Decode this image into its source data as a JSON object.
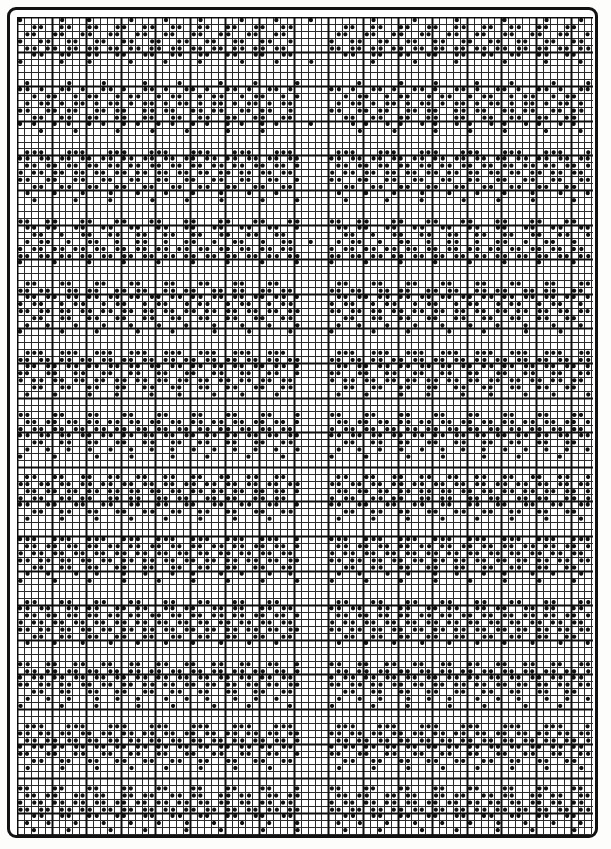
{
  "document": {
    "kind": "needlework-chart",
    "title": "Filet / Cross-Stitch Pattern Chart",
    "frame_color": "#121212",
    "paper_color": "#ffffff",
    "symbol_color": "#101010",
    "thin_line_color": "#2a2a2a",
    "thick_line_color": "#0d0d0d"
  },
  "chart_data": {
    "type": "heatmap",
    "title": "Filet / Cross-Stitch Pattern Chart",
    "xlabel": "",
    "ylabel": "",
    "grid": true,
    "legend_position": "none",
    "columns": 83,
    "rows": 120,
    "cell_px": 6.92,
    "heavy_every": 5,
    "thin_line_px": 1,
    "thick_line_px": 2,
    "symbol": "filled-dot",
    "symbol_radius_ratio": 0.3,
    "values_encoding": "each row string: '1' = stitch / filled dot, '0' = empty cell",
    "rows_data": [
      "10000010001000001000010000100000100001000010000000010000010000010000001000001000010",
      "00110011001100110011001100110011001100110000000110011001100110011001100110011001100",
      "01100110011001100110011001100110011001100000001100110011001100110011001100110011001",
      "10011001100110011001100110011001100110010000010011001100110011001100110011001100110",
      "01101101101101101101101101101101101101100000011011011011011011011011011011011011011",
      "00110011001100110011001100110011001100110000000110011001100110011001100110011001100",
      "10000010001000001000010000100000100001000010000000010000010000010000001000001000010",
      "00000000000000000000000000000000000000000000000000000000000000000000000000000000000",
      "00000000000000000000000000000000000000000000000000000000000000000000000000000000000",
      "01000001000010000010000100000100001000001000000001000001000010000010000100000100001",
      "11010011010011010011010011010011010011010000011010011010011010011010011010011010011",
      "00101100101100101100101100101100101100101000000101100101100101100101100101100101100",
      "01011010110101101011010110101101011010110000001011010110101101011010110101101011010",
      "11001101100110110011011001101100110110010000011001101100110110011011001101100110110",
      "00110011001100110011001100110011001100110000000110011001100110011001100110011001100",
      "10100101001010010100101001010010100101000010000010100101001010010100101001010010100",
      "00010000100000100001000010000010000100000000000001000010000010000100001000001000010",
      "00000000000000000000000000000000000000000000000000000000000000000000000000000000000",
      "00000000000000000000000000000000000000000000000000000000000000000000000000000000000",
      "01110001110001110001110001110001110001110000001110001110001110001110001110001110001",
      "11011011011011011011011011011011011011011000011011011011011011011011011011011011011",
      "01101101101101101101101101101101101101101000001101101101101101101101101101101101101",
      "10110110110110110110110110110110110110110000010110110110110110110110110110110110110",
      "11001100110011001100110011001100110011001000011001100110011001100110011001100110011",
      "00110011001100110011001100110011001100110000000110011001100110011001100110011001100",
      "01000100010001000100010001000100010001000000001000100010001000100010001000100010001",
      "00100000100001000001000010000100000100001000000100000100001000001000010000100000100",
      "00000000000000000000000000000000000000000000000000000000000000000000000000000000000",
      "00000000000000000000000000000000000000000000000000000000000000000000000000000000000",
      "11001100011000110001100011000110001100011000011001100011000110001100011000110001100",
      "01101100110011001100110011001100110011001000001101100110011001100110011001100110011",
      "00110010011001100110011001100110011001100000000110010011001100110011001100110011001",
      "01011001001100100110010011001001100100110010001011001001100100110010011001001100100",
      "10110110110110110110110110110110110110110000010110110110110110110110110110110110110",
      "11011011011011011011011011011011011011011000011011011011011011011011011011011011011",
      "10000100001000010000100001000010000100001000010000100001000010000100001000010000100",
      "00000000000000000000000000000000000000000000000000000000000000000000000000000000000",
      "00000000000000000000000000000000000000000000000000000000000000000000000000000000000",
      "01100011000110001100011000110001100011000000001100011000110001100011000110001100011",
      "11011001101100110110011011001101100110110000011011001101100110110011011001101100110",
      "01101101101101101101101101101101101101101000001101101101101101101101101101101101101",
      "10110010110010110010110010110010110010110000010110010110010110010110010110010110010",
      "11011011011011011011011011011011011011011000011011011011011011011011011011011011011",
      "00110011001100110011001100110011001100110000000110011001100110011001100110011001100",
      "01001000100010001000100010001000100010001000001001000100010001000100010001000100010",
      "10000010000100000100001000001000010000010000010000010000100000100001000001000010000",
      "00000000000000000000000000000000000000000000000000000000000000000000000000000000000",
      "00000000000000000000000000000000000000000000000000000000000000000000000000000000000",
      "01110011100111001110011100111001110011100000001110011100111001110011100111001110011",
      "11011011011011011011011011011011011011011000011011011011011011011011011011011011011",
      "01101101101101101101101101101101101101101000001101101101101101101101101101101101101",
      "11001100110011001100110011001100110011001000011001100110011001100110011001100110011",
      "10110110110110110110110110110110110110110000010110110110110110110110110110110110110",
      "00110011001100110011001100110011001100110000000110011001100110011001100110011001100",
      "01000100001000100001000100001000100001000000001000100001000100001000100001000100001",
      "00000000000000000000000000000000000000000000000000000000000000000000000000000000000",
      "00000000000000000000000000000000000000000000000000000000000000000000000000000000000",
      "11000110001100011000110001100011000110001000011000110001100011000110001100011000110",
      "01101101101101101101101101101101101101101000001101101101101101101101101101101101101",
      "10110110110110110110110110110110110110110000010110110110110110110110110110110110110",
      "11011011011011011011011011011011011011011000011011011011011011011011011011011011011",
      "00110011001100110011001100110011001100110000000110011001100110011001100110011001100",
      "01001001001001001001001001001001001001001000001001001001001001001001001001001001001",
      "10000100000100001000001000010000010000100000010000100000100001000001000010000010000",
      "00000000000000000000000000000000000000000000000000000000000000000000000000000000000",
      "00000000000000000000000000000000000000000000000000000000000000000000000000000000000",
      "01100110011001100110011001100110011001100000001100110011001100110011001100110011001",
      "11011011011011011011011011011011011011011000011011011011011011011011011011011011011",
      "01101101101101101101101101101101101101101000001101101101101101101101101101101101101",
      "10110011011001101100110110011011001101100000010110011011001101100110110011011001101",
      "11001100110011001100110011001100110011001000011001100110011001100110011001100110011",
      "00110011001100110011001100110011001100110000000110011001100110011001100110011001100",
      "01000010000100001000010000100001000010000000001000010000100001000010000100001000010",
      "00000000000000000000000000000000000000000000000000000000000000000000000000000000000",
      "00000000000000000000000000000000000000000000000000000000000000000000000000000000000",
      "11100111001110011100111001110011100111001000011100111001110011100111001110011100111",
      "01101101101101101101101101101101101101101000001101101101101101101101101101101101101",
      "10110110110110110110110110110110110110110000010110110110110110110110110110110110110",
      "11011011011011011011011011011011011011011000011011011011011011011011011011011011011",
      "00110011001100110011001100110011001100110000000110011001100110011001100110011001100",
      "01001000100100010010001001000100100010010000001001000100100010010001001000100100010",
      "10000100001000010000100001000010000100001000010000100001000010000100001000010000100",
      "00000000000000000000000000000000000000000000000000000000000000000000000000000000000",
      "00000000000000000000000000000000000000000000000000000000000000000000000000000000000",
      "01100011000110001100011000110001100011000000001100011000110001100011000110001100011",
      "11011001101100110110011011001101100110110000011011001101100110110011011001101100110",
      "01101101101101101101101101101101101101101000001101101101101101101101101101101101101",
      "10110110110110110110110110110110110110110000010110110110110110110110110110110110110",
      "11011011011011011011011011011011011011011000011011011011011011011011011011011011011",
      "00110011001100110011001100110011001100110000000110011001100110011001100110011001100",
      "01000100010001000100010001000100010001000000001000100010001000100010001000100010001",
      "00000000000000000000000000000000000000000000000000000000000000000000000000000000000",
      "00000000000000000000000000000000000000000000000000000000000000000000000000000000000",
      "11001100110011001100110011001100110011001000011001100110011001100110011001100110011",
      "01101101101101101101101101101101101101101000001101101101101101101101101101101101101",
      "10110110110110110110110110110110110110110000010110110110110110110110110110110110110",
      "11011011011011011011011011011011011011011000011011011011011011011011011011011011011",
      "00110011001100110011001100110011001100110000000110011001100110011001100110011001100",
      "01001001000100100100010010010001001001000000001001001000100100100010010010001001001",
      "10000010000100000100001000001000010000010000010000010000100000100001000001000010000",
      "00000000000000000000000000000000000000000000000000000000000000000000000000000000000",
      "00000000000000000000000000000000000000000000000000000000000000000000000000000000000",
      "01110001110001110001110001110001110001110000001110001110001110001110001110001110001",
      "11011011011011011011011011011011011011011000011011011011011011011011011011011011011",
      "01101101101101101101101101101101101101101000001101101101101101101101101101101101101",
      "10110110110110110110110110110110110110110000010110110110110110110110110110110110110",
      "11001100110011001100110011001100110011001000011001100110011001100110011001100110011",
      "00110011001100110011001100110011001100110000000110011001100110011001100110011001100",
      "01000010000100001000010000100001000010000000001000010000100001000010000100001000010",
      "00000000000000000000000000000000000000000000000000000000000000000000000000000000000",
      "00000000000000000000000000000000000000000000000000000000000000000000000000000000000",
      "11000110001100011000110001100011000110001000011000110001100011000110001100011000110",
      "01101100110110011011001101100110110011011000001101100110110011011001101100110110011",
      "10110110110110110110110110110110110110110000010110110110110110110110110110110110110",
      "11011011011011011011011011011011011011011000011011011011011011011011011011011011011",
      "00110011001100110011001100110011001100110000000110011001100110011001100110011001100",
      "01001000100010001000100010001000100010001000001001000100010001000100010001000100010",
      "00100001000001000010000010000100000100001000000100001000001000010000010000100000100",
      "00000000000000000000000000000000000000000000000000000000000000000000000000000000000",
      "00011000110001100011000110001100011000110000000011000110001100011000110001100011000",
      "00110011001100110011001100110011001100110000000110011001100110011001100110011001100"
    ]
  }
}
